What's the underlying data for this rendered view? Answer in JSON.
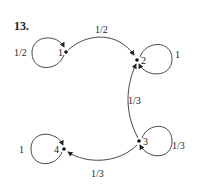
{
  "problem_number": "13.",
  "nodes": [
    {
      "id": "1",
      "label": "1"
    },
    {
      "id": "2",
      "label": "2"
    },
    {
      "id": "3",
      "label": "3"
    },
    {
      "id": "4",
      "label": "4"
    }
  ],
  "edges": [
    {
      "from": "1",
      "to": "1",
      "label": "1/2"
    },
    {
      "from": "1",
      "to": "2",
      "label": "1/2"
    },
    {
      "from": "2",
      "to": "2",
      "label": "1"
    },
    {
      "from": "3",
      "to": "2",
      "label": "1/3"
    },
    {
      "from": "3",
      "to": "3",
      "label": "1/3"
    },
    {
      "from": "3",
      "to": "4",
      "label": "1/3"
    },
    {
      "from": "4",
      "to": "4",
      "label": "1"
    }
  ]
}
